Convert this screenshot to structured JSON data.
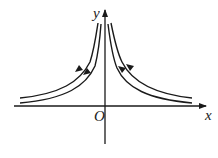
{
  "diagram": {
    "type": "field-lines",
    "axes": {
      "x_label": "x",
      "y_label": "y",
      "origin_label": "O"
    },
    "curves": [
      {
        "name": "left-outer",
        "arrow_direction": "up"
      },
      {
        "name": "left-inner",
        "arrow_direction": "up"
      },
      {
        "name": "right-inner",
        "arrow_direction": "down"
      },
      {
        "name": "right-outer",
        "arrow_direction": "down"
      }
    ],
    "colors": {
      "stroke": "#1a1a1a",
      "background": "#ffffff"
    }
  }
}
